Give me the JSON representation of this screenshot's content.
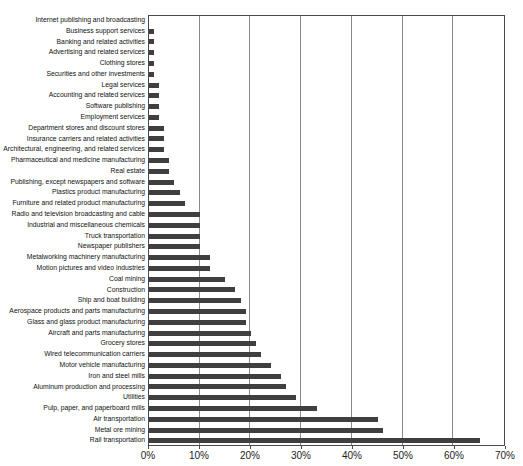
{
  "chart_data": {
    "type": "bar",
    "orientation": "horizontal",
    "title": "",
    "xlabel": "",
    "ylabel": "",
    "xlim": [
      0,
      70
    ],
    "x_ticks": [
      "0%",
      "10%",
      "20%",
      "30%",
      "40%",
      "50%",
      "60%",
      "70%"
    ],
    "grid": "vertical-gridlines-every-10-percent",
    "legend": "none",
    "bar_color": "#3f3f3f",
    "gridline_color": "#8a8a8a",
    "border_color": "#4a4a4a",
    "categories": [
      "Internet publishing and broadcasting",
      "Business support services",
      "Banking and related activities",
      "Advertising and related services",
      "Clothing stores",
      "Securities and other investments",
      "Legal services",
      "Accounting and related services",
      "Software publishing",
      "Employment services",
      "Department stores and discount stores",
      "Insurance carriers and related activities",
      "Architectural, engineering, and related services",
      "Pharmaceutical and medicine manufacturing",
      "Real estate",
      "Publishing, except newspapers and software",
      "Plastics product manufacturing",
      "Furniture and related product manufacturing",
      "Radio and television broadcasting and cable",
      "Industrial and miscellaneous chemicals",
      "Truck transportation",
      "Newspaper publishers",
      "Metalworking machinery manufacturing",
      "Motion pictures and video industries",
      "Coal mining",
      "Construction",
      "Ship and boat building",
      "Aerospace products and parts manufacturing",
      "Glass and glass product manufacturing",
      "Aircraft and parts manufacturing",
      "Grocery stores",
      "Wired telecommunication carriers",
      "Motor vehicle manufacturing",
      "Iron and steel mills",
      "Aluminum production and processing",
      "Utilities",
      "Pulp, paper, and paperboard mills",
      "Air transportation",
      "Metal ore mining",
      "Rail transportation"
    ],
    "values": [
      0,
      1,
      1,
      1,
      1,
      1,
      2,
      2,
      2,
      2,
      3,
      3,
      3,
      4,
      4,
      5,
      6,
      7,
      10,
      10,
      10,
      10,
      12,
      12,
      15,
      17,
      18,
      19,
      19,
      20,
      21,
      22,
      24,
      26,
      27,
      29,
      33,
      45,
      46,
      65
    ]
  }
}
